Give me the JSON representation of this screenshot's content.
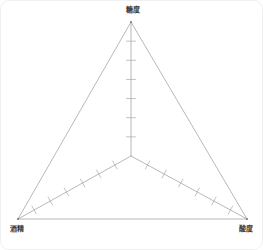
{
  "card": {
    "background": "#ffffff",
    "border_color": "#f0f0f0"
  },
  "chart_data": {
    "type": "diagram",
    "subtype": "balance-triangle",
    "title": "",
    "stroke_color": "#9a9a9a",
    "tick_color": "#a8a8a8",
    "vertices": [
      {
        "id": "top",
        "label": "糖度",
        "x": 130,
        "y": 21
      },
      {
        "id": "left",
        "label": "酒精",
        "x": 17,
        "y": 218
      },
      {
        "id": "right",
        "label": "酸度",
        "x": 246,
        "y": 218
      }
    ],
    "center": {
      "x": 130,
      "y": 155
    },
    "axes": [
      {
        "id": "axis-top",
        "from": "center",
        "to": "top",
        "ticks": 6,
        "tick_length": 9,
        "label": "糖度"
      },
      {
        "id": "axis-left",
        "from": "center",
        "to": "left",
        "ticks": 6,
        "tick_length": 9,
        "label": "酒精"
      },
      {
        "id": "axis-right",
        "from": "center",
        "to": "right",
        "ticks": 6,
        "tick_length": 9,
        "label": "酸度"
      }
    ],
    "xlabel": "",
    "ylabel": "",
    "legend": [],
    "grid": false
  },
  "labels": {
    "top": "糖度",
    "left": "酒精",
    "right": "酸度"
  }
}
